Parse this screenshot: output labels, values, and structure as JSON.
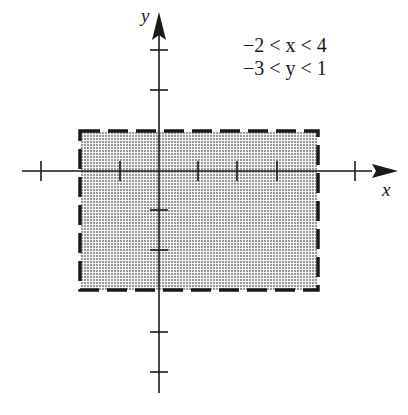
{
  "diagram": {
    "type": "coordinate-plane-region",
    "axes": {
      "x_label": "x",
      "y_label": "y",
      "x_ticks": [
        -3,
        -1,
        1,
        2,
        3,
        5
      ],
      "y_ticks": [
        3,
        2,
        1,
        -1,
        -2,
        -4,
        -5
      ]
    },
    "region": {
      "x_min": -2,
      "x_max": 4,
      "y_min": -3,
      "y_max": 1,
      "boundary": "dashed",
      "fill": "stippled gray"
    },
    "conditions": {
      "line1": "−2 < x < 4",
      "line2": "−3 < y < 1"
    },
    "colors": {
      "ink": "#1a1a1a",
      "fill": "#c8c8c8"
    }
  }
}
